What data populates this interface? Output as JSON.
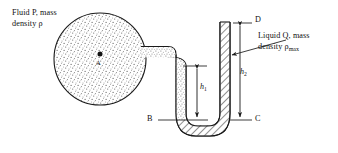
{
  "figure": {
    "type": "manometer-diagram",
    "background_color": "#ffffff",
    "line_color": "#1a1a1a"
  },
  "labels": {
    "fluid_p_line1": "Fluid P, mass",
    "fluid_p_line2": "density ρ",
    "liquid_q_line1": "Liquid Q, mass",
    "liquid_q_line2_prefix": "density ρ",
    "liquid_q_line2_subscript": "max",
    "point_a": "A",
    "point_b": "B",
    "point_c": "C",
    "point_d": "D",
    "height_1": "h",
    "height_1_subscript": "1",
    "height_2": "h",
    "height_2_subscript": "2"
  },
  "elements": {
    "sphere": {
      "name": "fluid-container-sphere",
      "center_x": 100,
      "center_y": 59,
      "radius": 46,
      "fill": "stipple"
    },
    "point_marker_a": {
      "x": 100,
      "y": 54
    },
    "left_tube_fill": "stipple",
    "right_tube_fill": "hatch",
    "dimension_h1": {
      "top_y": 66,
      "bottom_y": 120,
      "x": 194
    },
    "dimension_h2": {
      "top_y": 23,
      "bottom_y": 120,
      "x": 235
    },
    "level_line_b": {
      "y": 120
    },
    "level_line_c": {
      "y": 120
    },
    "level_line_d": {
      "y": 23
    }
  }
}
